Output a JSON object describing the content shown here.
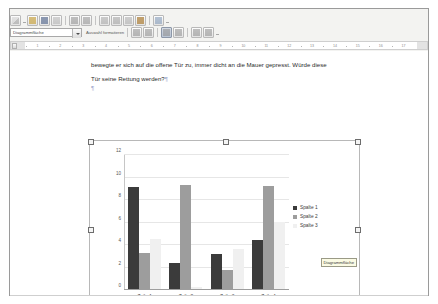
{
  "window": {
    "title": "Writer - Diagramm Bearbeitungsmodus"
  },
  "toolbar": {
    "icons": [
      {
        "name": "new-document-icon",
        "label": "Neu"
      },
      {
        "name": "open-document-icon",
        "label": "Öffnen"
      },
      {
        "name": "save-document-icon",
        "label": "Speichern"
      },
      {
        "name": "email-document-icon",
        "label": "Dokument als E-Mail"
      },
      {
        "name": "edit-file-icon",
        "label": "Bearbeiten"
      },
      {
        "name": "print-icon",
        "label": "Drucken"
      },
      {
        "name": "print-preview-icon",
        "label": "Seitenansicht"
      },
      {
        "name": "cut-icon",
        "label": "Ausschneiden"
      },
      {
        "name": "copy-icon",
        "label": "Kopieren"
      },
      {
        "name": "paste-icon",
        "label": "Einfügen"
      },
      {
        "name": "undo-icon",
        "label": "Rückgängig"
      }
    ]
  },
  "chart_toolbar": {
    "selection_combo_value": "Diagrammfläche",
    "format_selection_label": "Auswahl formatieren",
    "buttons": [
      {
        "name": "chart-type-button",
        "label": "Diagrammtyp"
      },
      {
        "name": "data-table-button",
        "label": "Datentabelle"
      },
      {
        "name": "horizontal-grid-button",
        "label": "Horizontale Gitter ein/aus",
        "pressed": true
      },
      {
        "name": "vertical-grid-button",
        "label": "Vertikale Gitter ein/aus",
        "pressed": false
      },
      {
        "name": "legend-button",
        "label": "Legende ein/aus"
      },
      {
        "name": "scale-text-button",
        "label": "Text skalieren"
      }
    ]
  },
  "ruler": {
    "ticks": [
      "1",
      "2",
      "3",
      "4",
      "5",
      "6",
      "7",
      "8",
      "9",
      "10",
      "11",
      "12",
      "13",
      "14",
      "15",
      "16",
      "17"
    ]
  },
  "document": {
    "paragraph_1": "bewegte er sich auf die offene Tür zu, immer dicht an die Mauer gepresst. Würde diese",
    "paragraph_2": "Tür seine Rettung werden?",
    "pilcrow": "¶"
  },
  "tooltip": {
    "text": "Diagrammfläche"
  },
  "chart_data": {
    "type": "bar",
    "title": "",
    "xlabel": "",
    "ylabel": "",
    "ylim": [
      0,
      12
    ],
    "yticks": [
      0,
      2,
      4,
      6,
      8,
      10,
      12
    ],
    "grid": true,
    "legend_position": "right",
    "categories": [
      "Zeile 1",
      "Zeile 2",
      "Zeile 3",
      "Zeile 4"
    ],
    "series": [
      {
        "name": "Spalte 1",
        "color": "#3b3b3b",
        "values": [
          9.1,
          2.3,
          3.1,
          4.4
        ]
      },
      {
        "name": "Spalte 2",
        "color": "#9d9d9d",
        "values": [
          3.2,
          9.3,
          1.7,
          9.2
        ]
      },
      {
        "name": "Spalte 3",
        "color": "#f0f0f0",
        "values": [
          4.5,
          0.2,
          3.6,
          6.0
        ]
      }
    ]
  }
}
